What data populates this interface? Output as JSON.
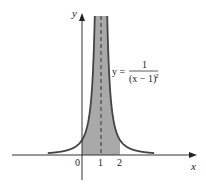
{
  "chart_data": {
    "type": "line",
    "title": "",
    "function_label": {
      "lhs": "y =",
      "numerator": "1",
      "denominator": "(x − 1)",
      "exponent": "2"
    },
    "xlabel": "x",
    "ylabel": "y",
    "x_ticks": [
      "0",
      "1",
      "2"
    ],
    "asymptote": {
      "x": 1,
      "style": "dashed"
    },
    "shaded_region": {
      "x_from": 0,
      "x_to": 2,
      "color": "#a9a9a9"
    },
    "curve_color": "#444444",
    "xlim": [
      -1.8,
      3.8
    ],
    "ylim": [
      -1.7,
      9.3
    ],
    "series": [
      {
        "name": "y = 1/(x-1)^2",
        "x": [
          -1.8,
          -1,
          0,
          0.5,
          0.7,
          1.3,
          1.5,
          2,
          3,
          3.8
        ],
        "y": [
          0.13,
          0.25,
          1,
          4,
          11.1,
          11.1,
          4,
          1,
          0.25,
          0.13
        ]
      }
    ],
    "grid": false,
    "legend": "none"
  }
}
